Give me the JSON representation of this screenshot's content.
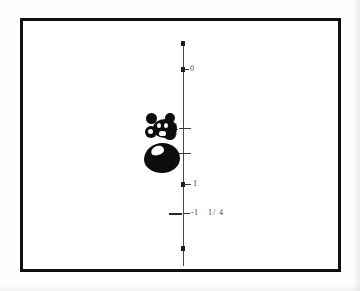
{
  "figure": {
    "kind": "scanned-number-line-figure",
    "background_color": "#ffffff",
    "frame_color": "#111111",
    "axis_color": "#4a4a4a",
    "ink_color": "#0d0d0d",
    "axis": {
      "orientation": "vertical",
      "name": "number-line"
    },
    "ticks": [
      {
        "id": "tick-0",
        "label": "0",
        "label_kind": "integer",
        "y": 67
      },
      {
        "id": "tick-three-quarters",
        "label": "3/4",
        "label_kind": "fraction",
        "numerator": "3",
        "denominator": "4",
        "y": 125
      },
      {
        "id": "tick-one-quarter",
        "label": "1/4",
        "label_kind": "fraction",
        "numerator": "1",
        "denominator": "4",
        "y": 150
      },
      {
        "id": "tick-1",
        "label": "1",
        "label_kind": "integer",
        "y": 182
      },
      {
        "id": "tick-neg-one-and-one-quarter",
        "label": "-1  1/4",
        "label_kind": "mixed-number",
        "whole": "-1",
        "numerator": "1",
        "denominator": "4",
        "y": 211
      }
    ],
    "blobs": [
      {
        "id": "blob-upper",
        "description": "irregular ink blob with white interior voids"
      },
      {
        "id": "blob-lower",
        "description": "solid ink oval with white highlight"
      }
    ]
  }
}
